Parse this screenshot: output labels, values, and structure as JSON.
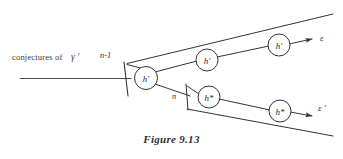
{
  "figure": {
    "caption": "Figure 9.13",
    "left_label": "conjectures of",
    "left_symbol": "γ ′",
    "stage_labels": {
      "n_minus_1": "n-1",
      "n": "n"
    },
    "outputs": {
      "top": "ε",
      "bottom": "ε ′"
    },
    "nodes": [
      {
        "id": "root",
        "label": "h′",
        "cx": 146,
        "cy": 78
      },
      {
        "id": "upper-mid",
        "label": "h′",
        "cx": 207,
        "cy": 60
      },
      {
        "id": "upper-right",
        "label": "h′",
        "cx": 279,
        "cy": 45
      },
      {
        "id": "lower-mid",
        "label": "h*",
        "cx": 209,
        "cy": 97
      },
      {
        "id": "lower-right",
        "label": "h*",
        "cx": 280,
        "cy": 111
      }
    ],
    "colors": {
      "stroke": "#333333",
      "text": "#2b2b2b",
      "background": "#ffffff"
    }
  }
}
